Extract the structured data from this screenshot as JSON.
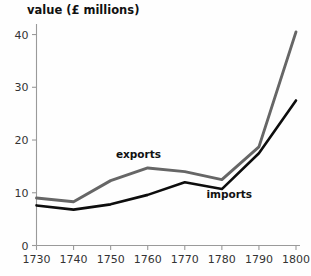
{
  "chart_data": {
    "type": "line",
    "title": "value (£ millions)",
    "xlabel": "",
    "ylabel": "value (£ millions)",
    "x": [
      1730,
      1740,
      1750,
      1760,
      1770,
      1780,
      1790,
      1800
    ],
    "xlim": [
      1730,
      1800
    ],
    "ylim": [
      0,
      42
    ],
    "xticks": [
      "1730",
      "1740",
      "1750",
      "1760",
      "1770",
      "1780",
      "1790",
      "1800"
    ],
    "yticks": [
      "0",
      "10",
      "20",
      "30",
      "40"
    ],
    "ytick_values": [
      0,
      10,
      20,
      30,
      40
    ],
    "grid": false,
    "legend_position": "inline-annotations",
    "series": [
      {
        "name": "exports",
        "color": "#666666",
        "values": [
          9.0,
          8.3,
          12.3,
          14.7,
          14.0,
          12.5,
          18.7,
          40.5
        ]
      },
      {
        "name": "imports",
        "color": "#0d0d0d",
        "values": [
          7.6,
          6.8,
          7.8,
          9.6,
          12.0,
          10.7,
          17.5,
          27.5
        ]
      }
    ],
    "annotations": [
      {
        "text": "exports",
        "x": 1757.5,
        "y": 16.6
      },
      {
        "text": "imports",
        "x": 1782.0,
        "y": 9.0
      }
    ]
  },
  "colors": {
    "exports_line": "#666666",
    "imports_line": "#0d0d0d",
    "axis": "#9a9a9a",
    "text": "#111111",
    "background": "#fefefe"
  }
}
